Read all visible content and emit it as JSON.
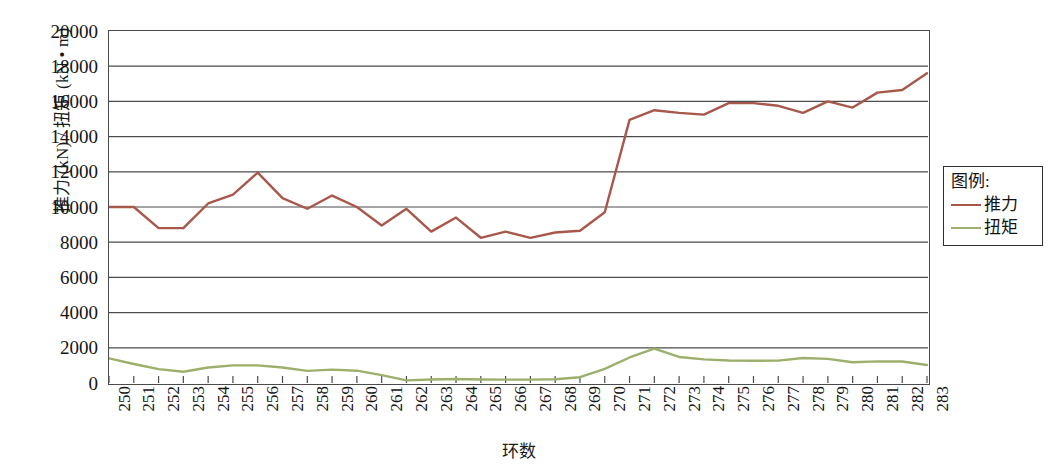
{
  "chart_data": {
    "type": "line",
    "title": "",
    "xlabel": "环数",
    "ylabel": "推力 (kN) / 扭矩 (kN • m)",
    "xlim": [
      250,
      283
    ],
    "ylim": [
      0,
      20000
    ],
    "ytick_step": 2000,
    "grid": true,
    "legend_position": "right-outside",
    "legend_title": "图例:",
    "categories": [
      "250",
      "251",
      "252",
      "253",
      "254",
      "255",
      "256",
      "257",
      "258",
      "259",
      "260",
      "261",
      "262",
      "263",
      "264",
      "265",
      "266",
      "267",
      "268",
      "269",
      "270",
      "271",
      "272",
      "273",
      "274",
      "275",
      "276",
      "277",
      "278",
      "279",
      "280",
      "281",
      "282",
      "283"
    ],
    "yticks": [
      "0",
      "2000",
      "4000",
      "6000",
      "8000",
      "10000",
      "12000",
      "14000",
      "16000",
      "18000",
      "20000"
    ],
    "series": [
      {
        "name": "推力",
        "color": "#a8584a",
        "values": [
          10000,
          10000,
          8800,
          8800,
          10200,
          10700,
          11950,
          10500,
          9900,
          10650,
          10000,
          8950,
          9900,
          8600,
          9400,
          8250,
          8600,
          8250,
          8550,
          8650,
          9700,
          14950,
          15500,
          15350,
          15250,
          15900,
          15900,
          15750,
          15350,
          16000,
          15650,
          16500,
          16650,
          17600
        ]
      },
      {
        "name": "扭矩",
        "color": "#9cb06c",
        "values": [
          1400,
          1080,
          790,
          640,
          880,
          1000,
          1000,
          880,
          690,
          760,
          700,
          450,
          150,
          200,
          230,
          200,
          190,
          190,
          210,
          330,
          800,
          1450,
          1950,
          1480,
          1340,
          1280,
          1260,
          1270,
          1420,
          1370,
          1180,
          1230,
          1220,
          1020
        ]
      }
    ]
  },
  "legend": {
    "title": "图例:",
    "entries": [
      {
        "label": "推力",
        "color": "#a8584a"
      },
      {
        "label": "扭矩",
        "color": "#9cb06c"
      }
    ]
  },
  "axes": {
    "x_title": "环数",
    "y_title": "推力 (kN) / 扭矩 (kN • m)"
  }
}
